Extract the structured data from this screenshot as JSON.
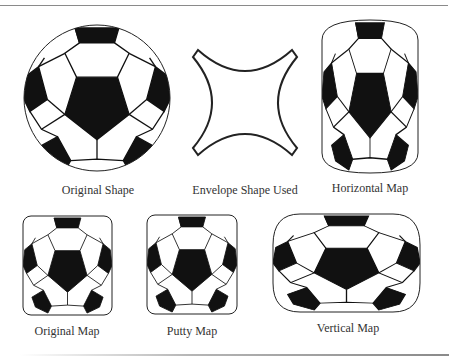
{
  "figure": {
    "panels": [
      {
        "id": "original-shape",
        "label": "Original Shape",
        "label_x": 98,
        "label_y": 183
      },
      {
        "id": "envelope-shape",
        "label": "Envelope Shape Used",
        "label_x": 245,
        "label_y": 183
      },
      {
        "id": "horizontal-map",
        "label": "Horizontal Map",
        "label_x": 370,
        "label_y": 181
      },
      {
        "id": "original-map",
        "label": "Original Map",
        "label_x": 67,
        "label_y": 324
      },
      {
        "id": "putty-map",
        "label": "Putty Map",
        "label_x": 192,
        "label_y": 324
      },
      {
        "id": "vertical-map",
        "label": "Vertical Map",
        "label_x": 348,
        "label_y": 321
      }
    ],
    "colors": {
      "ink": "#111111",
      "paper": "#ffffff",
      "rule": "#8a8a8a",
      "text": "#333333"
    }
  }
}
